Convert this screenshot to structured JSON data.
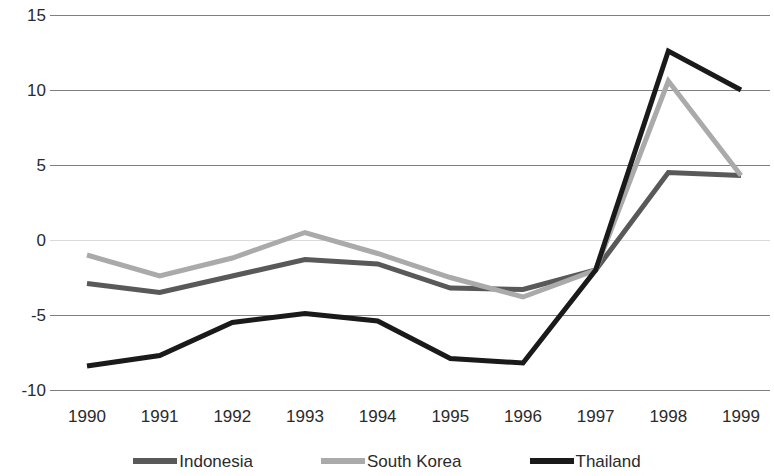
{
  "chart_data": {
    "type": "line",
    "title": "",
    "subtitle": "",
    "xlabel": "",
    "ylabel": "",
    "grid": true,
    "legend_position": "bottom",
    "x": [
      "1990",
      "1991",
      "1992",
      "1993",
      "1994",
      "1995",
      "1996",
      "1997",
      "1998",
      "1999"
    ],
    "categories": [
      "1990",
      "1991",
      "1992",
      "1993",
      "1994",
      "1995",
      "1996",
      "1997",
      "1998",
      "1999"
    ],
    "xlim": [
      "1990",
      "1999"
    ],
    "ylim": [
      -10,
      15
    ],
    "yticks": [
      15,
      10,
      5,
      0,
      -5,
      -10
    ],
    "ytick_labels": [
      "15",
      "10",
      "5",
      "0",
      "-5",
      "-10"
    ],
    "series": [
      {
        "name": "Indonesia",
        "color": "#595959",
        "values": [
          -2.9,
          -3.5,
          -2.4,
          -1.3,
          -1.6,
          -3.2,
          -3.3,
          -2.0,
          4.5,
          4.3
        ]
      },
      {
        "name": "South Korea",
        "color": "#aaaaaa",
        "values": [
          -1.0,
          -2.4,
          -1.2,
          0.5,
          -0.9,
          -2.5,
          -3.8,
          -2.0,
          10.6,
          4.3
        ]
      },
      {
        "name": "Thailand",
        "color": "#1a1a1a",
        "values": [
          -8.4,
          -7.7,
          -5.5,
          -4.9,
          -5.4,
          -7.9,
          -8.2,
          -2.0,
          12.6,
          10.0
        ]
      }
    ]
  },
  "legend": {
    "items": [
      {
        "label": "Indonesia",
        "color": "#595959"
      },
      {
        "label": "South Korea",
        "color": "#aaaaaa"
      },
      {
        "label": "Thailand",
        "color": "#1a1a1a"
      }
    ]
  },
  "axes": {
    "gridline_color": "#7f7f7f",
    "zero_line_color": "#d9d9d9",
    "tick_text_color": "#2b2b2b"
  }
}
